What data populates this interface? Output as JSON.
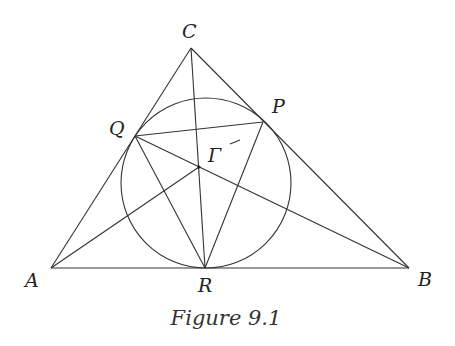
{
  "figure": {
    "caption": "Figure 9.1",
    "labels": {
      "A": "A",
      "B": "B",
      "C": "C",
      "P": "P",
      "Q": "Q",
      "R": "R",
      "G": "Γ"
    },
    "colors": {
      "stroke": "#333333",
      "background": "#ffffff"
    }
  }
}
